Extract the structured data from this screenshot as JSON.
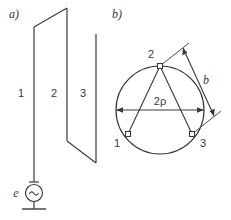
{
  "figure": {
    "panel_a": {
      "label": "a)",
      "conductor_labels": [
        "1",
        "2",
        "3"
      ],
      "source_label": "e",
      "source_symbol": "~"
    },
    "panel_b": {
      "label": "b)",
      "node_labels": [
        "1",
        "2",
        "3"
      ],
      "diameter_label": "2ρ",
      "chord_label": "b"
    },
    "colors": {
      "line": "#3a3a3a",
      "text": "#3a3a3a",
      "background": "#ffffff"
    }
  }
}
